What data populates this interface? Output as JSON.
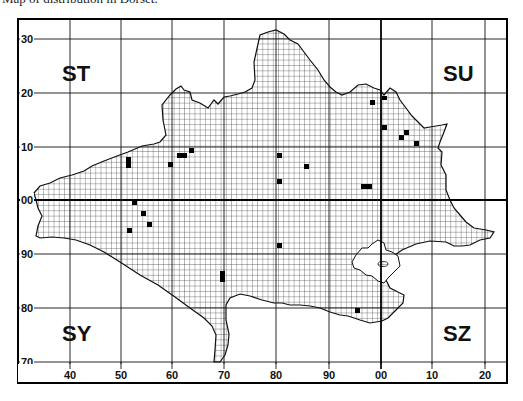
{
  "caption": "Map of distribution in Dorset.",
  "grid_squares": {
    "nw": "ST",
    "ne": "SU",
    "sw": "SY",
    "se": "SZ"
  },
  "y_axis": {
    "labels": [
      "30",
      "20",
      "10",
      "00",
      "90",
      "80",
      "70"
    ]
  },
  "x_axis": {
    "labels": [
      "40",
      "50",
      "60",
      "70",
      "80",
      "90",
      "00",
      "10",
      "20"
    ]
  },
  "colors": {
    "ink": "#111111",
    "paper": "#ffffff"
  },
  "records_count": 28
}
